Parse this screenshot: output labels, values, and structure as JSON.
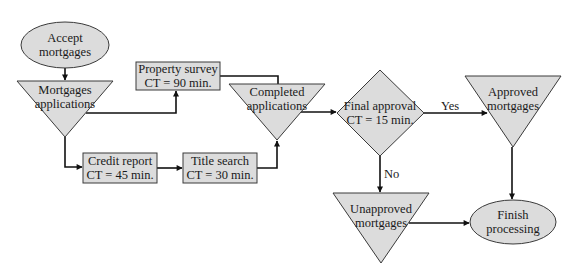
{
  "diagram": {
    "type": "process-flowchart",
    "colors": {
      "shape_fill": "#dcdcdc",
      "shape_stroke": "#3a3a3a",
      "edge": "#111111",
      "background": "#ffffff"
    },
    "nodes": {
      "accept_mortgages": {
        "shape": "ellipse",
        "line1": "Accept",
        "line2": "mortgages"
      },
      "mortgages_applications": {
        "shape": "inventory-triangle",
        "line1": "Mortgages",
        "line2": "applications"
      },
      "property_survey": {
        "shape": "process-box",
        "line1": "Property survey",
        "line2": "CT = 90 min."
      },
      "credit_report": {
        "shape": "process-box",
        "line1": "Credit report",
        "line2": "CT = 45 min."
      },
      "title_search": {
        "shape": "process-box",
        "line1": "Title search",
        "line2": "CT = 30 min."
      },
      "completed_applications": {
        "shape": "inventory-triangle",
        "line1": "Completed",
        "line2": "applications"
      },
      "final_approval": {
        "shape": "decision-diamond",
        "line1": "Final approval",
        "line2": "CT = 15 min."
      },
      "approved_mortgages": {
        "shape": "inventory-triangle",
        "line1": "Approved",
        "line2": "mortgages"
      },
      "unapproved_mortgages": {
        "shape": "inventory-triangle",
        "line1": "Unapproved",
        "line2": "mortgages"
      },
      "finish_processing": {
        "shape": "ellipse",
        "line1": "Finish",
        "line2": "processing"
      }
    },
    "edges": [
      {
        "from": "Accept mortgages",
        "to": "Mortgages applications",
        "label": ""
      },
      {
        "from": "Mortgages applications",
        "to": "Property survey",
        "label": ""
      },
      {
        "from": "Mortgages applications",
        "to": "Credit report",
        "label": ""
      },
      {
        "from": "Credit report",
        "to": "Title search",
        "label": ""
      },
      {
        "from": "Title search",
        "to": "Completed applications",
        "label": ""
      },
      {
        "from": "Property survey",
        "to": "Completed applications",
        "label": ""
      },
      {
        "from": "Completed applications",
        "to": "Final approval",
        "label": ""
      },
      {
        "from": "Final approval",
        "to": "Approved mortgages",
        "label": "Yes"
      },
      {
        "from": "Final approval",
        "to": "Unapproved mortgages",
        "label": "No"
      },
      {
        "from": "Approved mortgages",
        "to": "Finish processing",
        "label": ""
      },
      {
        "from": "Unapproved mortgages",
        "to": "Finish processing",
        "label": ""
      }
    ],
    "edge_labels": {
      "yes": "Yes",
      "no": "No"
    }
  }
}
